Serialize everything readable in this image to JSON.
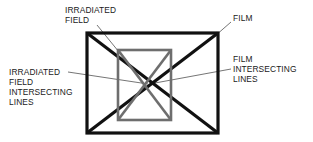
{
  "figure": {
    "background_color": "#ffffff"
  },
  "colors": {
    "film_stroke": "#111111",
    "irradiated_field_stroke": "#6e6e6e",
    "leader_line": "#3a3a3a",
    "text": "#1a1a1a"
  },
  "labels": {
    "irradiated_field": {
      "name": "IRRADIATED FIELD",
      "lines": [
        "IRRADIATED",
        "FIELD"
      ]
    },
    "irradiated_field_intersecting_lines": {
      "name": "IRRADIATED FIELD INTERSECTING LINES",
      "lines": [
        "IRRADIATED",
        "FIELD",
        "INTERSECTING",
        "LINES"
      ]
    },
    "film": {
      "name": "FILM",
      "lines": [
        "FILM"
      ]
    },
    "film_intersecting_lines": {
      "name": "FILM INTERSECTING LINES",
      "lines": [
        "FILM",
        "INTERSECTING",
        "LINES"
      ]
    }
  },
  "shapes": {
    "film_rect": {
      "label": "FILM",
      "x": 87,
      "y": 33,
      "width": 131,
      "height": 100,
      "stroke_width": 3.2,
      "color": "#111111"
    },
    "irradiated_field_rect": {
      "label": "IRRADIATED FIELD",
      "x": 118,
      "y": 50,
      "width": 53,
      "height": 70,
      "stroke_width": 2.6,
      "color": "#6e6e6e"
    },
    "film_intersecting_lines": {
      "label": "FILM INTERSECTING LINES",
      "stroke_width": 3.2,
      "color": "#111111",
      "center_x": 153,
      "center_y": 83
    },
    "irradiated_field_intersecting_lines": {
      "label": "IRRADIATED FIELD INTERSECTING LINES",
      "stroke_width": 2.6,
      "color": "#6e6e6e",
      "center_x": 145,
      "center_y": 85
    }
  }
}
